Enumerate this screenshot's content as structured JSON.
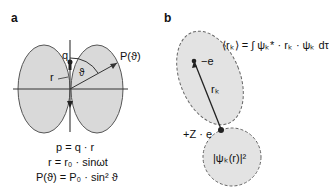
{
  "panel_a": {
    "label": "a",
    "charge_label": "q",
    "vector_label": "r",
    "angle_label": "ϑ",
    "power_label": "P(ϑ)",
    "equations": [
      "p = q · r",
      "r = r₀ · sinωt",
      "P(ϑ) = P₀ · sin² ϑ"
    ]
  },
  "panel_b": {
    "label": "b",
    "expectation_equation": "⟨rₖ⟩ = ∫ ψₖ* · rₖ · ψₖ dτ",
    "electron_label": "−e",
    "vector_label": "rₖ",
    "nucleus_label": "+Z · e",
    "density_label": "|ψₖ(r)|²"
  },
  "colors": {
    "lobe_fill": "#d9d9d9",
    "line": "#222222"
  }
}
